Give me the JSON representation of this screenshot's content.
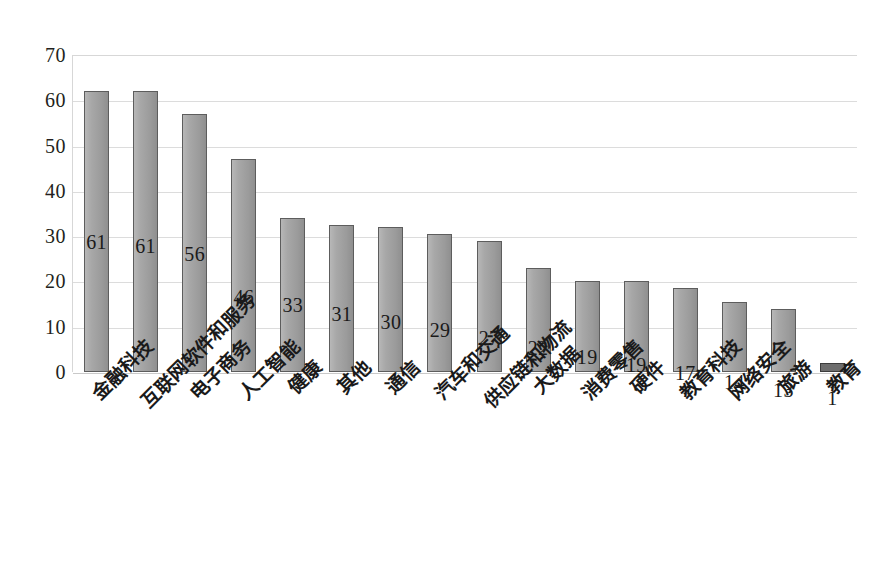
{
  "chart_data": {
    "type": "bar",
    "title": "",
    "subtitle": "",
    "xlabel": "",
    "ylabel": "",
    "ylim": [
      0,
      70
    ],
    "ytick_step": 10,
    "yticks": [
      70,
      60,
      50,
      40,
      30,
      20,
      10,
      0
    ],
    "grid": true,
    "legend": "none",
    "orientation": "vertical",
    "bar_color": "#a3a3a3",
    "bar_edge_color": "#5d5d5d",
    "gridline_color": "#dcdcdc",
    "categories": [
      "金融科技",
      "互联网软件和服务",
      "电子商务",
      "人工智能",
      "健康",
      "其他",
      "通信",
      "汽车和交通",
      "供应链和物流",
      "大数据",
      "消费零售",
      "硬件",
      "教育科技",
      "网络安全",
      "旅游",
      "教育"
    ],
    "values": [
      62,
      62,
      57,
      47,
      34,
      32.5,
      32,
      30.5,
      29,
      23,
      20,
      20,
      18.5,
      15.5,
      14,
      2
    ],
    "data_labels": [
      "61",
      "61",
      "56",
      "46",
      "33",
      "31",
      "30",
      "29",
      "27",
      "22",
      "19",
      "19",
      "17",
      "14",
      "13",
      "1"
    ]
  }
}
